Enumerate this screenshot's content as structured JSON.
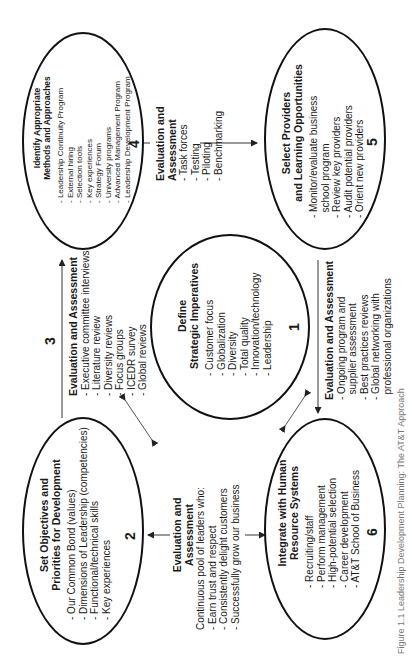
{
  "diagram": {
    "caption": "Figure 1.1  Leadership Development Planning: The AT&T Approach",
    "nodes": [
      {
        "number": "1",
        "title_line1": "Define",
        "title_line2": "Strategic Imperatives",
        "items": [
          "- Customer focus",
          "- Globalization",
          "- Diversity",
          "- Total quality",
          "- Innovation/technology",
          "- Leadership"
        ]
      },
      {
        "number": "2",
        "title_line1": "Set Objectives and",
        "title_line2": "Priorities for Development",
        "items": [
          "- Our Common Bond (values)",
          "- Dimensions of Leadership (competencies)",
          "- Functional/technical skills",
          "- Key experiences"
        ]
      },
      {
        "number": "3"
      },
      {
        "number": "4",
        "title_line1": "Identify Appropriate",
        "title_line2": "Methods and Approaches",
        "items": [
          "- Leadership Continuity Program",
          "- External hiring",
          "- Selection tools",
          "- Key experiences",
          "- Strategy Forum",
          "- University programs",
          "- Advanced Management Program",
          "- Leadership Development Program"
        ]
      },
      {
        "number": "5",
        "title_line1": "Select Providers",
        "title_line2": "and Learning Opportunities",
        "items": [
          "- Monitor/evaluate business",
          "  school program",
          "- Review key providers",
          "- Audit potential providers",
          "- Orient new providers"
        ]
      },
      {
        "number": "6",
        "title_line1": "Integrate with Human",
        "title_line2": "Resource Systems",
        "items": [
          "- Recruiting/staff",
          "- Perform management",
          "- High-potential selection",
          "- Career development",
          "- AT&T School of Business"
        ]
      }
    ],
    "evaluations": [
      {
        "id": "eval-2-3",
        "title": "Evaluation and Assessment",
        "items": [
          "- Executive committee interviews",
          "- Literature review",
          "- Diversity reviews",
          "- Focus groups",
          "- ICEDR survey",
          "- Global reviews"
        ]
      },
      {
        "id": "eval-4-5",
        "title_line1": "Evaluation and",
        "title_line2": "Assessment",
        "items": [
          "- Task forces",
          "- Testing",
          "- Piloting",
          "- Benchmarking"
        ]
      },
      {
        "id": "eval-5-6",
        "title": "Evaluation and Assessment",
        "items": [
          "- Ongoing program and",
          "  supplier assessment",
          "- Best practices reviews",
          "- Global networking with",
          "  professional organizations"
        ]
      },
      {
        "id": "eval-6-2",
        "title_line1": "Evaluation and",
        "title_line2": "Assessment",
        "intro": "Continuous pool of leaders who:",
        "items": [
          "- Earn trust and respect",
          "- Consistently delight customers",
          "- Successfully grow our business"
        ]
      }
    ]
  }
}
